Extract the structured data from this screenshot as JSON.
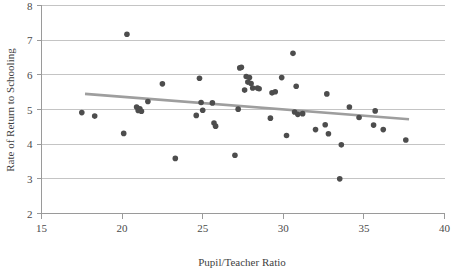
{
  "chart_data": {
    "type": "scatter",
    "title": "",
    "subtitle": "",
    "xlabel": "Pupil/Teacher Ratio",
    "ylabel": "Rate of Return to Schooling",
    "xlim": [
      15,
      40
    ],
    "ylim": [
      2,
      8
    ],
    "xticks": [
      15,
      20,
      25,
      30,
      35,
      40
    ],
    "xtick_labels": [
      "15",
      "20",
      "25",
      "30",
      "35",
      "40"
    ],
    "yticks": [
      2,
      3,
      4,
      5,
      6,
      7,
      8
    ],
    "ytick_labels": [
      "2",
      "3",
      "4",
      "5",
      "6",
      "7",
      "8"
    ],
    "grid": "horizontal",
    "legend": "none",
    "marker": "filled-circle",
    "marker_color": "#4d4d4d",
    "marker_size": 5.6,
    "gridline_color": "#b5b5b5",
    "axis_color": "#9a9a9a",
    "background_color": "#ffffff",
    "points": [
      [
        17.5,
        4.91
      ],
      [
        18.3,
        4.81
      ],
      [
        20.1,
        4.31
      ],
      [
        20.3,
        7.17
      ],
      [
        20.9,
        5.07
      ],
      [
        21.0,
        4.97
      ],
      [
        21.1,
        5.02
      ],
      [
        21.2,
        4.95
      ],
      [
        21.6,
        5.23
      ],
      [
        22.5,
        5.74
      ],
      [
        23.3,
        3.59
      ],
      [
        24.6,
        4.83
      ],
      [
        24.8,
        5.9
      ],
      [
        24.9,
        5.2
      ],
      [
        25.0,
        4.98
      ],
      [
        25.6,
        5.19
      ],
      [
        25.7,
        4.61
      ],
      [
        25.8,
        4.52
      ],
      [
        27.0,
        3.68
      ],
      [
        27.2,
        5.01
      ],
      [
        27.3,
        6.2
      ],
      [
        27.4,
        6.22
      ],
      [
        27.6,
        5.56
      ],
      [
        27.7,
        5.95
      ],
      [
        27.8,
        5.79
      ],
      [
        27.9,
        5.92
      ],
      [
        28.0,
        5.75
      ],
      [
        28.1,
        5.62
      ],
      [
        28.4,
        5.62
      ],
      [
        28.5,
        5.6
      ],
      [
        29.2,
        4.75
      ],
      [
        29.3,
        5.48
      ],
      [
        29.5,
        5.51
      ],
      [
        29.9,
        5.92
      ],
      [
        30.2,
        4.25
      ],
      [
        30.6,
        6.62
      ],
      [
        30.7,
        4.93
      ],
      [
        30.8,
        5.67
      ],
      [
        30.9,
        4.86
      ],
      [
        31.2,
        4.88
      ],
      [
        32.0,
        4.42
      ],
      [
        32.6,
        4.56
      ],
      [
        32.7,
        5.45
      ],
      [
        32.8,
        4.3
      ],
      [
        33.5,
        3.0
      ],
      [
        33.6,
        3.98
      ],
      [
        34.1,
        5.07
      ],
      [
        34.7,
        4.77
      ],
      [
        35.6,
        4.55
      ],
      [
        35.7,
        4.96
      ],
      [
        36.2,
        4.42
      ],
      [
        37.6,
        4.12
      ]
    ],
    "trendline": {
      "type": "linear",
      "color": "#9e9e9e",
      "x_start": 17.7,
      "y_start": 5.45,
      "x_end": 37.8,
      "y_end": 4.72
    }
  }
}
